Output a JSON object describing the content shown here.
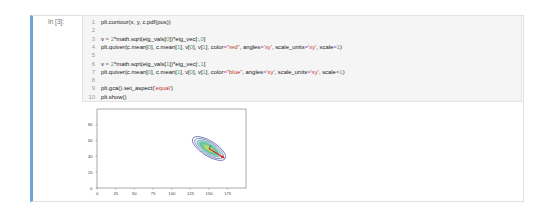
{
  "cell": {
    "prompt": "In [3]:",
    "lines": [
      {
        "n": "1",
        "parts": [
          {
            "t": "plt.contour(x, y, c.pdf(pos))",
            "c": ""
          }
        ]
      },
      {
        "n": "2",
        "parts": []
      },
      {
        "n": "3",
        "parts": [
          {
            "t": "v ",
            "c": ""
          },
          {
            "t": "=",
            "c": "op"
          },
          {
            "t": " ",
            "c": ""
          },
          {
            "t": "2",
            "c": "num"
          },
          {
            "t": "*math.sqrt(eig_vals[",
            "c": ""
          },
          {
            "t": "0",
            "c": "num"
          },
          {
            "t": "])*eig_vec[:,",
            "c": ""
          },
          {
            "t": "0",
            "c": "num"
          },
          {
            "t": "]",
            "c": ""
          }
        ]
      },
      {
        "n": "4",
        "parts": [
          {
            "t": "plt.quiver(c.mean[",
            "c": ""
          },
          {
            "t": "0",
            "c": "num"
          },
          {
            "t": "], c.mean[",
            "c": ""
          },
          {
            "t": "1",
            "c": "num"
          },
          {
            "t": "], v[",
            "c": ""
          },
          {
            "t": "0",
            "c": "num"
          },
          {
            "t": "], v[",
            "c": ""
          },
          {
            "t": "1",
            "c": "num"
          },
          {
            "t": "], color",
            "c": ""
          },
          {
            "t": "=",
            "c": "op"
          },
          {
            "t": "\"red\"",
            "c": "str"
          },
          {
            "t": ", angles",
            "c": ""
          },
          {
            "t": "=",
            "c": "op"
          },
          {
            "t": "'xy'",
            "c": "str"
          },
          {
            "t": ", scale_units",
            "c": ""
          },
          {
            "t": "=",
            "c": "op"
          },
          {
            "t": "'xy'",
            "c": "str"
          },
          {
            "t": ", scale",
            "c": ""
          },
          {
            "t": "=",
            "c": "op"
          },
          {
            "t": "1",
            "c": "num"
          },
          {
            "t": ")",
            "c": ""
          }
        ]
      },
      {
        "n": "5",
        "parts": []
      },
      {
        "n": "6",
        "parts": [
          {
            "t": "v ",
            "c": ""
          },
          {
            "t": "=",
            "c": "op"
          },
          {
            "t": " ",
            "c": ""
          },
          {
            "t": "2",
            "c": "num"
          },
          {
            "t": "*math.sqrt(eig_vals[",
            "c": ""
          },
          {
            "t": "1",
            "c": "num"
          },
          {
            "t": "])*eig_vec[:,",
            "c": ""
          },
          {
            "t": "1",
            "c": "num"
          },
          {
            "t": "]",
            "c": ""
          }
        ]
      },
      {
        "n": "7",
        "parts": [
          {
            "t": "plt.quiver(c.mean[",
            "c": ""
          },
          {
            "t": "0",
            "c": "num"
          },
          {
            "t": "], c.mean[",
            "c": ""
          },
          {
            "t": "1",
            "c": "num"
          },
          {
            "t": "], v[",
            "c": ""
          },
          {
            "t": "0",
            "c": "num"
          },
          {
            "t": "], v[",
            "c": ""
          },
          {
            "t": "1",
            "c": "num"
          },
          {
            "t": "], color",
            "c": ""
          },
          {
            "t": "=",
            "c": "op"
          },
          {
            "t": "\"blue\"",
            "c": "str"
          },
          {
            "t": ", angles",
            "c": ""
          },
          {
            "t": "=",
            "c": "op"
          },
          {
            "t": "'xy'",
            "c": "str"
          },
          {
            "t": ", scale_units",
            "c": ""
          },
          {
            "t": "=",
            "c": "op"
          },
          {
            "t": "'xy'",
            "c": "str"
          },
          {
            "t": ", scale",
            "c": ""
          },
          {
            "t": "=",
            "c": "op"
          },
          {
            "t": "1",
            "c": "num"
          },
          {
            "t": ")",
            "c": ""
          }
        ]
      },
      {
        "n": "8",
        "parts": []
      },
      {
        "n": "9",
        "parts": [
          {
            "t": "plt.gca().set_aspect(",
            "c": ""
          },
          {
            "t": "'equal'",
            "c": "str"
          },
          {
            "t": ")",
            "c": ""
          }
        ]
      },
      {
        "n": "10",
        "parts": [
          {
            "t": "plt.show()",
            "c": ""
          }
        ]
      }
    ]
  },
  "output": {
    "plot": {
      "x_ticks": [
        "0",
        "25",
        "50",
        "75",
        "100",
        "125",
        "150",
        "175"
      ],
      "y_ticks": [
        "0",
        "20",
        "40",
        "60",
        "80"
      ]
    }
  },
  "colors": {
    "cell_border_left": "#6aa6d8",
    "code_bg": "#f5f5f5",
    "string": "#c0392b",
    "number": "#5ba65b",
    "operator": "#9c5fb5",
    "arrow_red": "#d62728",
    "arrow_blue": "#1f3fbf"
  },
  "chart_data": {
    "type": "contour",
    "title": "",
    "xlabel": "",
    "ylabel": "",
    "x_ticks": [
      0,
      25,
      50,
      75,
      100,
      125,
      150,
      175
    ],
    "y_ticks": [
      0,
      20,
      40,
      60,
      80
    ],
    "xlim": [
      0,
      200
    ],
    "ylim": [
      0,
      100
    ],
    "grid": false,
    "contour_center": [
      150,
      50
    ],
    "contour_orientation": "tilted ellipse, major axis descending left-to-right",
    "arrows": [
      {
        "name": "eigvec0",
        "color": "red",
        "from": [
          150,
          50
        ],
        "to": [
          167,
          41
        ]
      },
      {
        "name": "eigvec1",
        "color": "blue",
        "from": [
          150,
          50
        ],
        "to": [
          152,
          54
        ]
      }
    ]
  }
}
